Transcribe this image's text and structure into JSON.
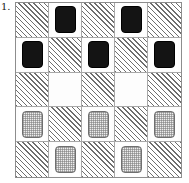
{
  "figure": {
    "label": "1.",
    "type": "checkers-board-diagram",
    "board": {
      "rows": 5,
      "cols": 5,
      "dark_square_style": "hatched",
      "light_square_style": "plain"
    },
    "colors": {
      "hatch_line": "#6e6e6e",
      "light_square": "#fdfdfd",
      "board_border": "#8d8d8d",
      "grid_line": "#a8a8a8",
      "dark_piece": "#141414",
      "light_piece_fill": "#ededed",
      "light_piece_border": "#707070"
    },
    "squares": [
      [
        {
          "square": "hatched",
          "piece": "none"
        },
        {
          "square": "plain",
          "piece": "dark"
        },
        {
          "square": "hatched",
          "piece": "none"
        },
        {
          "square": "plain",
          "piece": "dark"
        },
        {
          "square": "hatched",
          "piece": "none"
        }
      ],
      [
        {
          "square": "plain",
          "piece": "dark"
        },
        {
          "square": "hatched",
          "piece": "none"
        },
        {
          "square": "plain",
          "piece": "dark"
        },
        {
          "square": "hatched",
          "piece": "none"
        },
        {
          "square": "plain",
          "piece": "dark"
        }
      ],
      [
        {
          "square": "hatched",
          "piece": "none"
        },
        {
          "square": "plain",
          "piece": "none"
        },
        {
          "square": "hatched",
          "piece": "none"
        },
        {
          "square": "plain",
          "piece": "none"
        },
        {
          "square": "hatched",
          "piece": "none"
        }
      ],
      [
        {
          "square": "plain",
          "piece": "light"
        },
        {
          "square": "hatched",
          "piece": "none"
        },
        {
          "square": "plain",
          "piece": "light"
        },
        {
          "square": "hatched",
          "piece": "none"
        },
        {
          "square": "plain",
          "piece": "light"
        }
      ],
      [
        {
          "square": "hatched",
          "piece": "none"
        },
        {
          "square": "plain",
          "piece": "light"
        },
        {
          "square": "hatched",
          "piece": "none"
        },
        {
          "square": "plain",
          "piece": "light"
        },
        {
          "square": "hatched",
          "piece": "none"
        }
      ]
    ]
  }
}
